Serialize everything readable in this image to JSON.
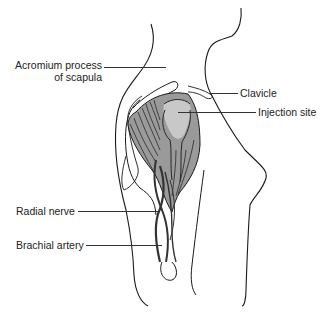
{
  "figure": {
    "colors": {
      "outline": "#1a1a1a",
      "muscle": "#9a9a9a",
      "injection_site": "#c8c8c8",
      "background": "#ffffff",
      "label_text": "#222222"
    }
  },
  "labels": {
    "acromium_line1": "Acromium process",
    "acromium_line2": "of scapula",
    "clavicle": "Clavicle",
    "injection_site": "Injection site",
    "radial_nerve": "Radial nerve",
    "brachial_artery": "Brachial artery"
  }
}
